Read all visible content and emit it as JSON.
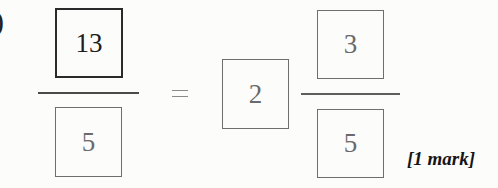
{
  "question": {
    "label_fragment": ")",
    "lhs_fraction": {
      "numerator": "13",
      "denominator": "5"
    },
    "operator": "=",
    "rhs_mixed_number": {
      "whole": "2",
      "numerator": "3",
      "denominator": "5"
    },
    "marks": "[1 mark]"
  },
  "colors": {
    "background": "#fcfcfb",
    "dark_ink": "#1e1e1e",
    "answer_ink": "#6a6a6a"
  }
}
